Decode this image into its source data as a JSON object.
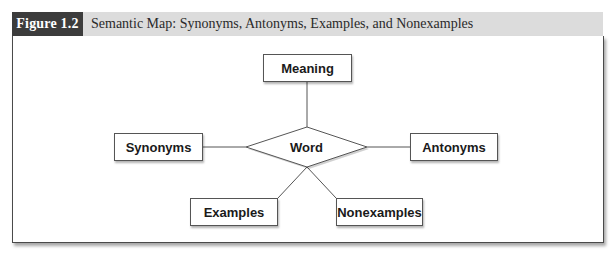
{
  "figure": {
    "label": "Figure 1.2",
    "title": "Semantic Map: Synonyms, Antonyms, Examples, and Nonexamples",
    "colors": {
      "label_bg": "#3c3c3c",
      "header_bg": "#dcdcdc",
      "border": "#4a4a4a"
    }
  },
  "diagram": {
    "center": {
      "label": "Word",
      "shape": "diamond"
    },
    "nodes": [
      {
        "id": "meaning",
        "label": "Meaning",
        "position": "top"
      },
      {
        "id": "synonyms",
        "label": "Synonyms",
        "position": "left"
      },
      {
        "id": "antonyms",
        "label": "Antonyms",
        "position": "right"
      },
      {
        "id": "examples",
        "label": "Examples",
        "position": "bottom-left"
      },
      {
        "id": "nonexamples",
        "label": "Nonexamples",
        "position": "bottom-right"
      }
    ],
    "edges": [
      {
        "from": "word",
        "to": "meaning"
      },
      {
        "from": "word",
        "to": "synonyms"
      },
      {
        "from": "word",
        "to": "antonyms"
      },
      {
        "from": "word",
        "to": "examples"
      },
      {
        "from": "word",
        "to": "nonexamples"
      }
    ]
  }
}
